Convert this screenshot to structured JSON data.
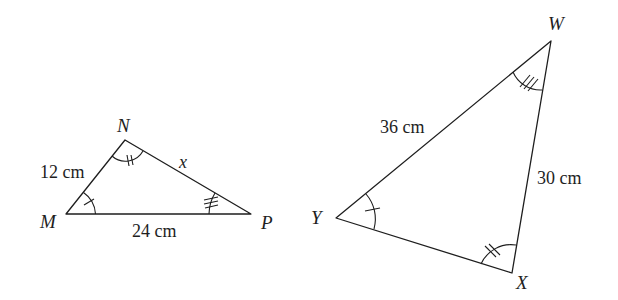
{
  "diagram": {
    "type": "similar-triangles",
    "background": "#ffffff",
    "stroke_color": "#1e1e1e",
    "triangles": [
      {
        "name": "MNP",
        "vertices": [
          {
            "label": "M",
            "x": 66,
            "y": 214
          },
          {
            "label": "N",
            "x": 125,
            "y": 140
          },
          {
            "label": "P",
            "x": 251,
            "y": 214
          }
        ],
        "side_labels": {
          "MN": "12 cm",
          "NP": "x",
          "MP": "24 cm"
        },
        "angle_marks": {
          "M": "single arc, 1 tick",
          "N": "single arc, 2 ticks",
          "P": "single arc, 3 ticks"
        }
      },
      {
        "name": "WXY",
        "vertices": [
          {
            "label": "W",
            "x": 551,
            "y": 41
          },
          {
            "label": "X",
            "x": 512,
            "y": 273
          },
          {
            "label": "Y",
            "x": 336,
            "y": 218
          }
        ],
        "side_labels": {
          "YW": "36 cm",
          "WX": "30 cm"
        },
        "angle_marks": {
          "Y": "single arc, 1 tick",
          "X": "single arc, 2 ticks",
          "W": "single arc, 3 ticks"
        }
      }
    ]
  },
  "labels": {
    "M": "M",
    "N": "N",
    "P": "P",
    "W": "W",
    "X": "X",
    "Y": "Y",
    "mn": "12 cm",
    "np": "x",
    "mp": "24 cm",
    "yw": "36 cm",
    "wx": "30 cm"
  }
}
